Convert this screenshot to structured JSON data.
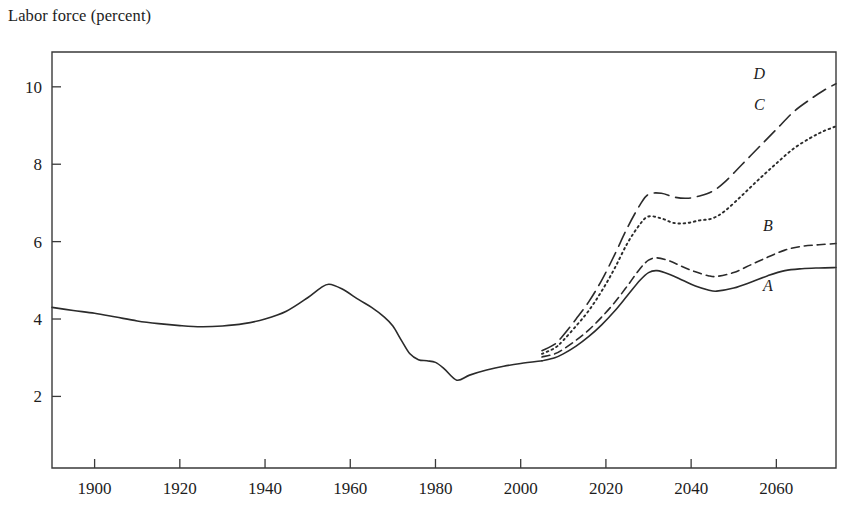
{
  "figure": {
    "axis_title": "Labor force (percent)",
    "background_color": "#ffffff",
    "line_color": "#2b2b2b",
    "axis_color": "#3a3a3a"
  },
  "chart_data": {
    "type": "line",
    "title": "",
    "ylabel": "Labor force (percent)",
    "xlabel": "",
    "xlim": [
      1890,
      2074
    ],
    "ylim": [
      0.15,
      10.9
    ],
    "xticks": [
      1900,
      1920,
      1940,
      1960,
      1980,
      2000,
      2020,
      2040,
      2060
    ],
    "yticks": [
      2,
      4,
      6,
      8,
      10
    ],
    "xtick_labels": [
      "1900",
      "1920",
      "1940",
      "1960",
      "1980",
      "2000",
      "2020",
      "2040",
      "2060"
    ],
    "ytick_labels": [
      "2",
      "4",
      "6",
      "8",
      "10"
    ],
    "grid": false,
    "legend": "inline-labels-at-right",
    "series": [
      {
        "name": "historical",
        "label": "",
        "style": "solid",
        "x": [
          1890,
          1895,
          1900,
          1905,
          1910,
          1915,
          1920,
          1925,
          1930,
          1935,
          1940,
          1945,
          1950,
          1953,
          1955,
          1958,
          1962,
          1965,
          1968,
          1970,
          1972,
          1974,
          1976,
          1978,
          1980,
          1982,
          1985,
          1988,
          1992,
          1996,
          2000,
          2005
        ],
        "y": [
          4.3,
          4.22,
          4.15,
          4.05,
          3.95,
          3.88,
          3.83,
          3.8,
          3.82,
          3.88,
          4.0,
          4.2,
          4.55,
          4.8,
          4.9,
          4.78,
          4.5,
          4.3,
          4.05,
          3.82,
          3.45,
          3.1,
          2.95,
          2.92,
          2.88,
          2.72,
          2.42,
          2.55,
          2.68,
          2.78,
          2.85,
          2.92
        ]
      },
      {
        "name": "A",
        "label": "A",
        "style": "solid",
        "label_x": 2058,
        "label_y": 4.72,
        "x": [
          2005,
          2008,
          2010,
          2013,
          2016,
          2019,
          2022,
          2025,
          2028,
          2030,
          2032,
          2035,
          2038,
          2041,
          2044,
          2046,
          2050,
          2054,
          2058,
          2062,
          2066,
          2070,
          2074
        ],
        "y": [
          2.92,
          3.0,
          3.1,
          3.3,
          3.55,
          3.85,
          4.2,
          4.6,
          5.0,
          5.2,
          5.25,
          5.15,
          5.0,
          4.85,
          4.75,
          4.72,
          4.8,
          4.95,
          5.12,
          5.25,
          5.3,
          5.32,
          5.33
        ]
      },
      {
        "name": "B",
        "label": "B",
        "style": "short-dash",
        "label_x": 2058,
        "label_y": 6.28,
        "x": [
          2005,
          2008,
          2010,
          2013,
          2016,
          2019,
          2022,
          2025,
          2028,
          2030,
          2032,
          2035,
          2038,
          2041,
          2044,
          2046,
          2050,
          2054,
          2058,
          2062,
          2066,
          2070,
          2074
        ],
        "y": [
          3.02,
          3.1,
          3.22,
          3.45,
          3.72,
          4.05,
          4.42,
          4.85,
          5.3,
          5.52,
          5.58,
          5.5,
          5.35,
          5.22,
          5.12,
          5.1,
          5.2,
          5.4,
          5.6,
          5.78,
          5.88,
          5.92,
          5.95
        ]
      },
      {
        "name": "C",
        "label": "C",
        "style": "dotted",
        "label_x": 2056,
        "label_y": 9.4,
        "x": [
          2005,
          2008,
          2010,
          2013,
          2016,
          2019,
          2022,
          2025,
          2028,
          2030,
          2033,
          2036,
          2039,
          2042,
          2045,
          2048,
          2052,
          2056,
          2060,
          2064,
          2068,
          2071,
          2074
        ],
        "y": [
          3.1,
          3.25,
          3.45,
          3.82,
          4.22,
          4.72,
          5.3,
          5.95,
          6.45,
          6.65,
          6.6,
          6.48,
          6.48,
          6.55,
          6.6,
          6.8,
          7.2,
          7.62,
          8.02,
          8.4,
          8.68,
          8.85,
          8.98
        ]
      },
      {
        "name": "D",
        "label": "D",
        "style": "long-dash",
        "label_x": 2056,
        "label_y": 10.2,
        "x": [
          2005,
          2008,
          2010,
          2013,
          2016,
          2019,
          2022,
          2025,
          2028,
          2030,
          2033,
          2036,
          2039,
          2042,
          2045,
          2048,
          2052,
          2056,
          2060,
          2064,
          2068,
          2071,
          2074
        ],
        "y": [
          3.18,
          3.35,
          3.58,
          4.0,
          4.45,
          5.0,
          5.65,
          6.35,
          6.95,
          7.22,
          7.25,
          7.15,
          7.12,
          7.18,
          7.3,
          7.55,
          8.0,
          8.45,
          8.9,
          9.35,
          9.68,
          9.9,
          10.08
        ]
      }
    ]
  }
}
